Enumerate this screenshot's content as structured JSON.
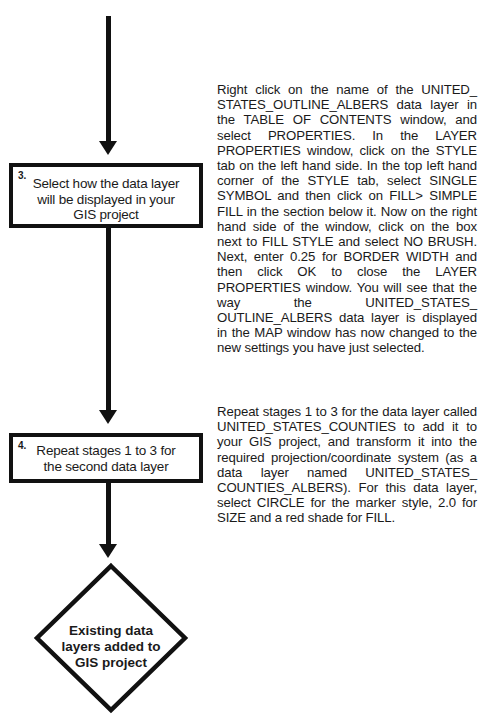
{
  "flowchart": {
    "steps": [
      {
        "number": "3.",
        "label": "Select how the data layer will be displayed in your GIS project",
        "description": "Right click on the name of the UNITED_ STATES_OUTLINE_ALBERS data layer in the TABLE OF CONTENTS window, and select PROPERTIES. In the LAYER PROPERTIES window, click on the STYLE tab on the left hand side. In the top left hand corner of the STYLE tab, select SINGLE SYMBOL and then click on FILL> SIMPLE FILL in the section below it. Now on the right hand side of the window, click on the box next to FILL STYLE and select NO BRUSH. Next, enter 0.25 for BORDER WIDTH and then click OK to close the LAYER PROPERTIES window. You will see that the way the UNITED_STATES_ OUTLINE_ALBERS data layer is displayed in the MAP window has now changed to the new settings you have just selected."
      },
      {
        "number": "4.",
        "label": "Repeat stages 1 to 3 for the second data layer",
        "description": "Repeat stages 1 to 3 for the data layer called UNITED_STATES_COUNTIES to add it to your GIS project, and transform it into the required projection/coordinate system (as a data layer named UNITED_STATES_ COUNTIES_ALBERS). For this data layer, select CIRCLE for the marker style, 2.0 for SIZE and a red shade for FILL."
      }
    ],
    "outcome": {
      "shape": "diamond",
      "label": "Existing data layers added to GIS project"
    },
    "colors": {
      "line": "#111111",
      "background": "#ffffff",
      "text": "#1a1a1a"
    }
  }
}
